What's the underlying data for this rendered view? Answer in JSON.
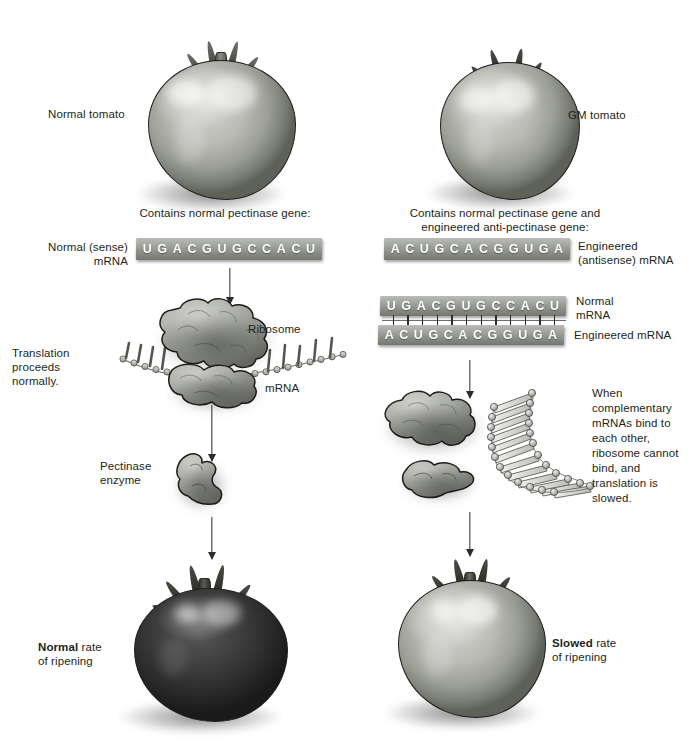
{
  "figure": {
    "type": "biology-process-diagram"
  },
  "left_column": {
    "tomato_label": "Normal tomato",
    "gene_caption": "Contains normal pectinase gene:",
    "mrna_label_line1": "Normal (sense)",
    "mrna_label_line2": "mRNA",
    "mrna_sequence": [
      "U",
      "G",
      "A",
      "C",
      "G",
      "U",
      "G",
      "C",
      "C",
      "A",
      "C",
      "U"
    ],
    "translation_note_line1": "Translation",
    "translation_note_line2": "proceeds",
    "translation_note_line3": "normally.",
    "ribosome_label": "Ribosome",
    "mrna_strand_label": "mRNA",
    "enzyme_label_line1": "Pectinase",
    "enzyme_label_line2": "enzyme",
    "result_bold": "Normal",
    "result_rest": " rate",
    "result_line2": "of ripening"
  },
  "right_column": {
    "tomato_label": "GM tomato",
    "gene_caption_line1": "Contains normal pectinase gene and",
    "gene_caption_line2": "engineered anti-pectinase gene:",
    "antisense_sequence": [
      "A",
      "C",
      "U",
      "G",
      "C",
      "A",
      "C",
      "G",
      "G",
      "U",
      "G",
      "A"
    ],
    "antisense_label_line1": "Engineered",
    "antisense_label_line2": "(antisense) mRNA",
    "duplex": {
      "top_sequence": [
        "U",
        "G",
        "A",
        "C",
        "G",
        "U",
        "G",
        "C",
        "C",
        "A",
        "C",
        "U"
      ],
      "top_label_line1": "Normal",
      "top_label_line2": "mRNA",
      "bottom_sequence": [
        "A",
        "C",
        "U",
        "G",
        "C",
        "A",
        "C",
        "G",
        "G",
        "U",
        "G",
        "A"
      ],
      "bottom_label": "Engineered mRNA",
      "bond_count": 12
    },
    "explanation": "When complementary mRNAs bind to each other, ribosome cannot bind, and translation is slowed.",
    "result_bold": "Slowed",
    "result_rest": " rate",
    "result_line2": "of ripening"
  },
  "colors": {
    "text": "#231f20",
    "strand_light": "#b9bcb7",
    "strand_dark": "#73776f",
    "arrow": "#2c2c2c",
    "outline": "#1d1d1d",
    "unripe_tomato": "#9b9e95",
    "ripe_tomato": "#333333"
  }
}
